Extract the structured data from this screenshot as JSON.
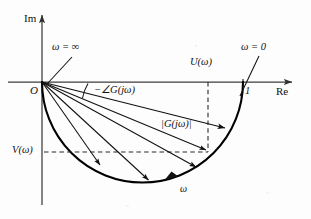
{
  "figure": {
    "kind": "nyquist-polar-plot",
    "axes": {
      "imaginary_label": "Im",
      "real_label": "Re",
      "origin_label": "O"
    },
    "ticks": {
      "real_unit": "1"
    },
    "annotations": {
      "omega_infinity": "ω = ∞",
      "omega_zero": "ω = 0",
      "phase": "−∠G(jω)",
      "magnitude": "|G(jω)|",
      "real_part": "U(ω)",
      "imag_part": "V(ω)",
      "omega_direction": "ω"
    },
    "colors": {
      "ink": "#111111",
      "axis": "#3c3c3c",
      "locus": "#000000",
      "dashed": "#2a2a2a",
      "background": "#fdfdfd"
    },
    "geometry": {
      "origin": [
        42,
        82
      ],
      "point_one": [
        243,
        82
      ],
      "locus_center": [
        142.5,
        82
      ],
      "locus_radius": 100.5,
      "u_line_x": 208,
      "v_line_y": 152,
      "sample_point": [
        208,
        152
      ]
    }
  }
}
